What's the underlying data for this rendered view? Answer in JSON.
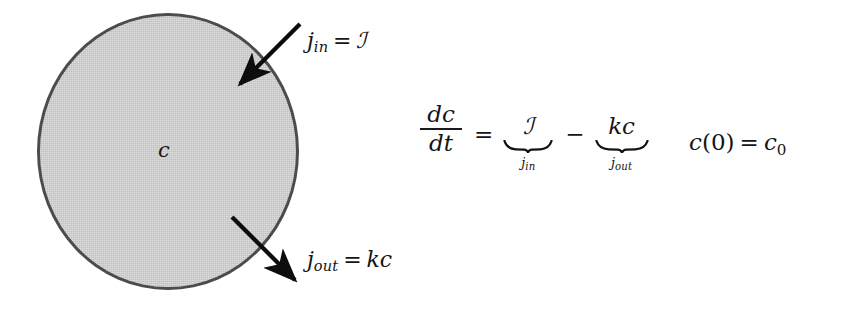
{
  "figure": {
    "type": "compartment-model-diagram",
    "background_color": "#ffffff",
    "ink_color": "#141414"
  },
  "compartment": {
    "name": "well-mixed-compartment",
    "label": "c",
    "fill_color": "#c9c9c9",
    "stroke_color": "#4c4c4c",
    "shape": "circle"
  },
  "fluxes": {
    "inflow": {
      "name": "j_in",
      "symbol": "j",
      "subscript": "in",
      "relation": "=",
      "value": "ℐ",
      "direction": "into-compartment",
      "arrow_from": [
        300,
        24
      ],
      "arrow_to": [
        238,
        86
      ]
    },
    "outflow": {
      "name": "j_out",
      "symbol": "j",
      "subscript": "out",
      "relation": "=",
      "value": "kc",
      "direction": "out-of-compartment",
      "arrow_from": [
        232,
        217
      ],
      "arrow_to": [
        297,
        282
      ]
    }
  },
  "equation": {
    "derivative": {
      "numerator": "dc",
      "denominator": "dt"
    },
    "equals": "=",
    "inflow_term": {
      "expression": "ℐ",
      "brace_label_symbol": "j",
      "brace_label_subscript": "in"
    },
    "operator": "−",
    "outflow_term": {
      "expression": "kc",
      "brace_label_symbol": "j",
      "brace_label_subscript": "out"
    }
  },
  "initial_condition": {
    "function": "c",
    "open_paren": "(",
    "argument": "0",
    "close_paren": ")",
    "equals": "=",
    "value_symbol": "c",
    "value_subscript": "0"
  }
}
